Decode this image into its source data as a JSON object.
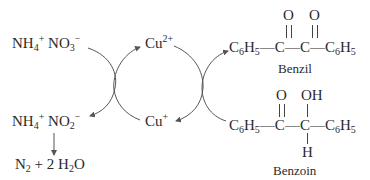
{
  "diagram": {
    "type": "coupled redox cycle",
    "left_cycle": {
      "top_species": {
        "ion1": "NH",
        "ion1_sub": "4",
        "ion1_sup": "+",
        "ion2": "NO",
        "ion2_sub": "3",
        "ion2_sup": "−"
      },
      "bottom_species": {
        "ion1": "NH",
        "ion1_sub": "4",
        "ion1_sup": "+",
        "ion2": "NO",
        "ion2_sub": "2",
        "ion2_sup": "−"
      },
      "decomposition_products": {
        "n2": "N",
        "n2_sub": "2",
        "plus": "+",
        "water_coeff": "2",
        "water_h": "H",
        "water_h_sub": "2",
        "water_o": "O"
      }
    },
    "copper": {
      "oxidized": {
        "symbol": "Cu",
        "charge": "2+"
      },
      "reduced": {
        "symbol": "Cu",
        "charge": "+"
      }
    },
    "benzil": {
      "label": "Benzil",
      "phenyl_left": {
        "c": "C",
        "c_sub": "6",
        "h": "H",
        "h_sub": "5"
      },
      "phenyl_right": {
        "c": "C",
        "c_sub": "6",
        "h": "H",
        "h_sub": "5"
      },
      "carbon": "C",
      "oxygen": "O",
      "bond": "—",
      "double_bond": "‖"
    },
    "benzoin": {
      "label": "Benzoin",
      "phenyl_left": {
        "c": "C",
        "c_sub": "6",
        "h": "H",
        "h_sub": "5"
      },
      "phenyl_right": {
        "c": "C",
        "c_sub": "6",
        "h": "H",
        "h_sub": "5"
      },
      "carbon": "C",
      "oxygen": "O",
      "hydroxyl": "OH",
      "hydrogen": "H",
      "bond": "—",
      "double_bond": "‖",
      "single_bond_v": "|"
    },
    "colors": {
      "text": "#2a2a2a",
      "arrow": "#555555"
    }
  }
}
